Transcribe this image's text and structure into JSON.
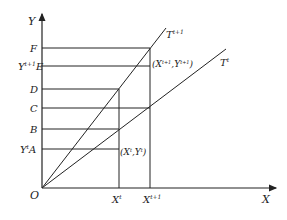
{
  "diagram": {
    "axes": {
      "y_label": "Y",
      "x_label": "X",
      "origin_label": "O"
    },
    "y_levels": [
      {
        "label": "F",
        "y": 48
      },
      {
        "label": "Y",
        "sup": "t+1",
        "suffix": "E",
        "y": 66
      },
      {
        "label": "D",
        "y": 89
      },
      {
        "label": "C",
        "y": 108
      },
      {
        "label": "B",
        "y": 129
      },
      {
        "label": "Y",
        "sup": "t",
        "suffix": "A",
        "y": 149
      }
    ],
    "x_levels": [
      {
        "label": "X",
        "sup": "t",
        "x": 119
      },
      {
        "label": "X",
        "sup": "t+1",
        "x": 150
      }
    ],
    "lines": [
      {
        "name": "T",
        "sup": "t+1"
      },
      {
        "name": "T",
        "sup": "t"
      }
    ],
    "points": [
      {
        "label": "(X",
        "sup1": "t",
        "mid": ",Y",
        "sup2": "t",
        "end": ")"
      },
      {
        "label": "(X",
        "sup1": "t+1",
        "mid": ",Y",
        "sup2": "t+1",
        "end": ")"
      }
    ],
    "colors": {
      "stroke": "#222222",
      "background": "#ffffff"
    }
  }
}
